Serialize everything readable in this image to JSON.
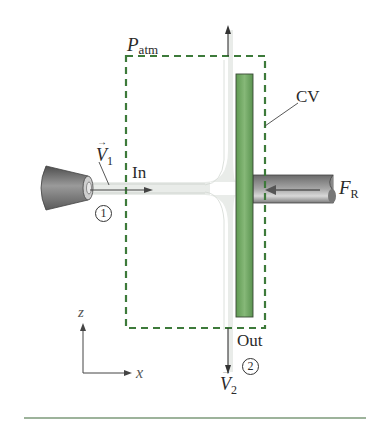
{
  "figure": {
    "colors": {
      "cv_dash": "#3d7a3a",
      "plate_fill": "#6fa660",
      "plate_edge": "#3a4a36",
      "jet": "#e6e9e6",
      "nozzle": "#7a7a7a",
      "rod": "#8a8a8a",
      "text": "#2a2a2a",
      "bottom_rule": "#7d9a7a"
    }
  },
  "labels": {
    "p_atm_symbol": "P",
    "p_atm_sub": "atm",
    "cv": "CV",
    "inlet": "In",
    "outlet": "Out",
    "v1_symbol": "V",
    "v1_sub": "1",
    "v2_symbol": "V",
    "v2_sub": "2",
    "station1": "1",
    "station2": "2",
    "force_symbol": "F",
    "force_sub": "R",
    "axis_z": "z",
    "axis_x": "x"
  }
}
